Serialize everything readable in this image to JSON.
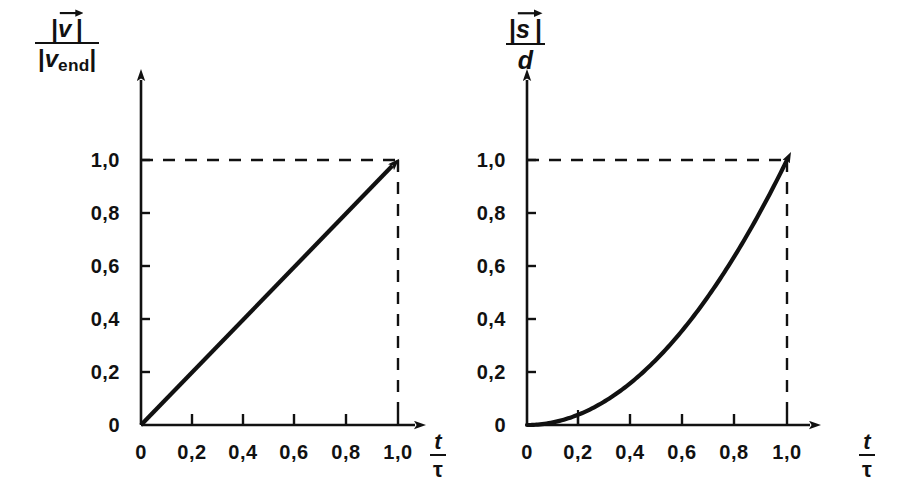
{
  "figure": {
    "background": "#ffffff",
    "ink": "#111111",
    "width": 917,
    "height": 501
  },
  "chart_data": [
    {
      "id": "velocity",
      "type": "line",
      "title": "",
      "ylabel_numerator": "|v|",
      "ylabel_numerator_symbol": "v",
      "ylabel_denominator_symbol": "v",
      "ylabel_denominator_subscript": "end",
      "ylabel_text": "|v⃗| / |v_end|",
      "xlabel_numerator": "t",
      "xlabel_denominator": "τ",
      "xlabel_text": "t / τ",
      "xlim": [
        0,
        1.18
      ],
      "ylim": [
        0,
        1.18
      ],
      "xticks": [
        0,
        0.2,
        0.4,
        0.6,
        0.8,
        1.0
      ],
      "yticks": [
        0,
        0.2,
        0.4,
        0.6,
        0.8,
        1.0
      ],
      "xticklabels": [
        "0",
        "0,2",
        "0,4",
        "0,6",
        "0,8",
        "1,0"
      ],
      "yticklabels": [
        "0",
        "0,2",
        "0,4",
        "0,6",
        "0,8",
        "1,0"
      ],
      "grid": false,
      "legend": "none",
      "series": [
        {
          "name": "|v|/|v_end| = t/τ",
          "relation": "linear",
          "x": [
            0,
            0.1,
            0.2,
            0.3,
            0.4,
            0.5,
            0.6,
            0.7,
            0.8,
            0.9,
            1.0
          ],
          "y": [
            0,
            0.1,
            0.2,
            0.3,
            0.4,
            0.5,
            0.6,
            0.7,
            0.8,
            0.9,
            1.0
          ],
          "style": "solid",
          "arrow_end": true
        }
      ],
      "annotations": [
        {
          "kind": "dashed-horizontal",
          "y": 1.0,
          "from_x": 0,
          "to_x": 1.0
        },
        {
          "kind": "dashed-vertical",
          "x": 1.0,
          "from_y": 0,
          "to_y": 1.0
        }
      ]
    },
    {
      "id": "displacement",
      "type": "line",
      "title": "",
      "ylabel_numerator_symbol": "s",
      "ylabel_denominator_symbol": "d",
      "ylabel_text": "|s⃗| / d",
      "xlabel_numerator": "t",
      "xlabel_denominator": "τ",
      "xlabel_text": "t / τ",
      "xlim": [
        0,
        1.18
      ],
      "ylim": [
        0,
        1.18
      ],
      "xticks": [
        0,
        0.2,
        0.4,
        0.6,
        0.8,
        1.0
      ],
      "yticks": [
        0,
        0.2,
        0.4,
        0.6,
        0.8,
        1.0
      ],
      "xticklabels": [
        "0",
        "0,2",
        "0,4",
        "0,6",
        "0,8",
        "1,0"
      ],
      "yticklabels": [
        "0",
        "0,2",
        "0,4",
        "0,6",
        "0,8",
        "1,0"
      ],
      "grid": false,
      "legend": "none",
      "series": [
        {
          "name": "|s|/d = (t/τ)²",
          "relation": "quadratic",
          "x": [
            0,
            0.1,
            0.2,
            0.3,
            0.4,
            0.5,
            0.6,
            0.7,
            0.8,
            0.9,
            1.0
          ],
          "y": [
            0,
            0.01,
            0.04,
            0.09,
            0.16,
            0.25,
            0.36,
            0.49,
            0.64,
            0.81,
            1.0
          ],
          "style": "solid",
          "arrow_end": true
        }
      ],
      "annotations": [
        {
          "kind": "dashed-horizontal",
          "y": 1.0,
          "from_x": 0,
          "to_x": 1.0
        },
        {
          "kind": "dashed-vertical",
          "x": 1.0,
          "from_y": 0,
          "to_y": 1.0
        }
      ]
    }
  ],
  "left_chart": {
    "ylabel": {
      "numerator_bar": "|",
      "numerator_symbol": "v",
      "denominator_symbol": "v",
      "denominator_subscript": "end"
    },
    "xlabel": {
      "numerator": "t",
      "denominator": "τ"
    },
    "yticklabels": [
      "0",
      "0,2",
      "0,4",
      "0,6",
      "0,8",
      "1,0"
    ],
    "xticklabels": [
      "0",
      "0,2",
      "0,4",
      "0,6",
      "0,8",
      "1,0"
    ]
  },
  "right_chart": {
    "ylabel": {
      "numerator_symbol": "s",
      "denominator_symbol": "d"
    },
    "xlabel": {
      "numerator": "t",
      "denominator": "τ"
    },
    "yticklabels": [
      "0",
      "0,2",
      "0,4",
      "0,6",
      "0,8",
      "1,0"
    ],
    "xticklabels": [
      "0",
      "0,2",
      "0,4",
      "0,6",
      "0,8",
      "1,0"
    ]
  }
}
